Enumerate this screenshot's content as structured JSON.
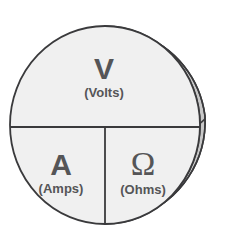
{
  "figure": {
    "name": "ohms-law-cylinder-diagram",
    "shape": "cylinder",
    "colors": {
      "front_face_fill": "#f0f0f0",
      "side_surface_fill": "#c8c8c8",
      "outline": "#3a3a3c",
      "divider_line": "#3a3a3c",
      "text": "#555557",
      "background": "#ffffff"
    }
  },
  "segments": [
    {
      "id": "voltage",
      "symbol": "V",
      "unit": "(Volts)",
      "position": "top-half"
    },
    {
      "id": "current",
      "symbol": "A",
      "unit": "(Amps)",
      "position": "bottom-left"
    },
    {
      "id": "resistance",
      "symbol": "Ω",
      "unit": "(Ohms)",
      "position": "bottom-right"
    }
  ]
}
